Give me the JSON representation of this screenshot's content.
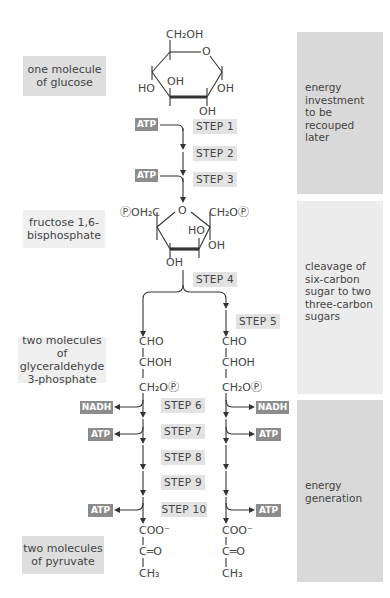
{
  "phases": [
    {
      "id": "investment",
      "text": "energy investment to be recouped later",
      "lines": [
        "energy",
        "investment",
        "to be",
        "recouped",
        "later"
      ]
    },
    {
      "id": "cleavage",
      "text": "cleavage of six-carbon sugar to two three-carbon sugars",
      "lines": [
        "cleavage of",
        "six-carbon",
        "sugar to two",
        "three-carbon",
        "sugars"
      ]
    },
    {
      "id": "generation",
      "text": "energy generation",
      "lines": [
        "energy",
        "generation"
      ]
    }
  ],
  "molecules": {
    "glucose": {
      "label_lines": [
        "one molecule",
        "of glucose"
      ]
    },
    "fructose": {
      "label_lines": [
        "fructose 1,6-",
        "bisphosphate"
      ]
    },
    "g3p": {
      "label_lines": [
        "two molecules of",
        "glyceraldehyde",
        "3-phosphate"
      ]
    },
    "pyruvate": {
      "label_lines": [
        "two molecules",
        "of pyruvate"
      ]
    }
  },
  "glucose_structure": {
    "ch2oh": "CH₂OH",
    "o": "O",
    "oh_inner": "OH",
    "ho_left": "HO",
    "oh_right": "OH",
    "oh_bottom": "OH"
  },
  "fructose_structure": {
    "left": "ⓅOH₂C",
    "o": "O",
    "right": "CH₂OⓅ",
    "ho": "HO",
    "oh_right": "OH",
    "oh_bottom": "OH"
  },
  "g3p_structure": {
    "c1": "CHO",
    "c2": "CHOH",
    "c3": "CH₂OⓅ"
  },
  "pyruvate_structure": {
    "c1": "COO⁻",
    "c2": "C═O",
    "c3": "CH₃"
  },
  "steps": [
    "STEP 1",
    "STEP 2",
    "STEP 3",
    "STEP 4",
    "STEP 5",
    "STEP 6",
    "STEP 7",
    "STEP 8",
    "STEP 9",
    "STEP 10"
  ],
  "cofactors": {
    "atp": "ATP",
    "nadh": "NADH"
  },
  "colors": {
    "panel": "#d9d9d9",
    "panel_light": "#ececec",
    "tag": "#8c8c8c",
    "step_bg": "#e3e3e3",
    "line": "#333333"
  }
}
